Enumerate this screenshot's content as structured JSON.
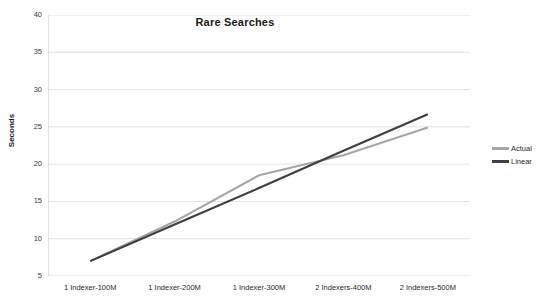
{
  "chart_data": {
    "type": "line",
    "title": "Rare Searches",
    "xlabel": "",
    "ylabel": "Seconds",
    "categories": [
      "1 Indexer-100M",
      "1 Indexer-200M",
      "1 Indexer-300M",
      "2 Indexers-400M",
      "2 Indexers-500M"
    ],
    "series": [
      {
        "name": "Actual",
        "color": "#a6a6a6",
        "values": [
          7.0,
          12.3,
          18.5,
          21.2,
          24.9
        ]
      },
      {
        "name": "Linear",
        "color": "#3f3f3f",
        "values": [
          7.0,
          11.9,
          16.8,
          21.8,
          26.7
        ]
      }
    ],
    "ylim": [
      5,
      40
    ],
    "yticks": [
      5,
      10,
      15,
      20,
      25,
      30,
      35,
      40
    ],
    "ytick_labels": [
      "5",
      "10",
      "15",
      "20",
      "25",
      "30",
      "35",
      "40"
    ],
    "grid": "horizontal",
    "legend_position": "right",
    "gridline_color": "#d9d9d9",
    "axis_color": "#bfbfbf",
    "background": "#ffffff"
  }
}
